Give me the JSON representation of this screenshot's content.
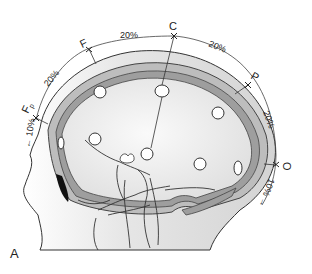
{
  "figure": {
    "panel_label": "A",
    "electrodes": [
      {
        "id": "Fp",
        "label": "Fp"
      },
      {
        "id": "F",
        "label": "F"
      },
      {
        "id": "C",
        "label": "C"
      },
      {
        "id": "P",
        "label": "P"
      },
      {
        "id": "O",
        "label": "O"
      }
    ],
    "segments": [
      {
        "from": "nasion",
        "to": "Fp",
        "label": "10%"
      },
      {
        "from": "Fp",
        "to": "F",
        "label": "20%"
      },
      {
        "from": "F",
        "to": "C",
        "label": "20%"
      },
      {
        "from": "C",
        "to": "P",
        "label": "20%"
      },
      {
        "from": "P",
        "to": "O",
        "label": "20%"
      },
      {
        "from": "O",
        "to": "inion",
        "label": "10%"
      }
    ]
  }
}
